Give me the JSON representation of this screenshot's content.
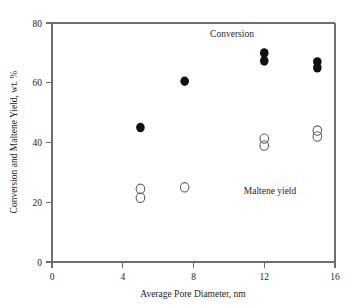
{
  "chart_data": {
    "type": "scatter",
    "title": "",
    "xlabel": "Average Pore Diameter, nm",
    "ylabel": "Conversion and Maltene Yield, wt. %",
    "xlim": [
      0,
      16
    ],
    "ylim": [
      0,
      80
    ],
    "xticks": [
      0,
      4,
      8,
      12,
      16
    ],
    "xtick_labels": [
      "0",
      "4",
      "8",
      "12",
      "16"
    ],
    "yticks": [
      0,
      20,
      40,
      60,
      80
    ],
    "ytick_labels": [
      "0",
      "20",
      "40",
      "60",
      "80"
    ],
    "grid": false,
    "legend_position": "inline-annotations",
    "annotations": [
      {
        "text": "Conversion",
        "x": 10.2,
        "y": 75.0
      },
      {
        "text": "Maltene yield",
        "x": 11.5,
        "y": 25.5
      }
    ],
    "series": [
      {
        "name": "Conversion",
        "marker": "filled-circle",
        "color": "#101010",
        "points": [
          {
            "x": 5.0,
            "y": 45.0
          },
          {
            "x": 7.5,
            "y": 60.5
          },
          {
            "x": 12.0,
            "y": 70.0
          },
          {
            "x": 12.0,
            "y": 67.3
          },
          {
            "x": 15.0,
            "y": 67.0
          },
          {
            "x": 15.0,
            "y": 65.0
          }
        ]
      },
      {
        "name": "Maltene yield",
        "marker": "open-circle",
        "color": "#5a5a5a",
        "points": [
          {
            "x": 5.0,
            "y": 24.5
          },
          {
            "x": 5.0,
            "y": 21.5
          },
          {
            "x": 7.5,
            "y": 25.0
          },
          {
            "x": 12.0,
            "y": 41.3
          },
          {
            "x": 12.0,
            "y": 39.0
          },
          {
            "x": 15.0,
            "y": 44.0
          },
          {
            "x": 15.0,
            "y": 42.0
          }
        ]
      }
    ]
  },
  "axes": {
    "x_title": "Average Pore Diameter, nm",
    "y_title": "Conversion and Maltene Yield, wt. %",
    "x_tick_0": "0",
    "x_tick_1": "4",
    "x_tick_2": "8",
    "x_tick_3": "12",
    "x_tick_4": "16",
    "y_tick_0": "0",
    "y_tick_1": "20",
    "y_tick_2": "40",
    "y_tick_3": "60",
    "y_tick_4": "80"
  },
  "labels": {
    "conversion": "Conversion",
    "maltene_yield": "Maltene yield"
  },
  "colors": {
    "filled_marker": "#101010",
    "open_marker": "#5a5a5a",
    "axis": "#6e6e6e",
    "text": "#231f20",
    "background": "#ffffff"
  }
}
